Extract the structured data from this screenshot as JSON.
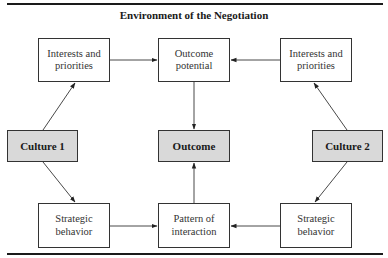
{
  "title": "Environment of the Negotiation",
  "nodes": {
    "interests_left": {
      "label": "Interests and\npriorities"
    },
    "outcome_potential": {
      "label": "Outcome\npotential"
    },
    "interests_right": {
      "label": "Interests and\npriorities"
    },
    "culture_1": {
      "label": "Culture 1"
    },
    "outcome": {
      "label": "Outcome"
    },
    "culture_2": {
      "label": "Culture 2"
    },
    "strategic_left": {
      "label": "Strategic\nbehavior"
    },
    "pattern": {
      "label": "Pattern of\ninteraction"
    },
    "strategic_right": {
      "label": "Strategic\nbehavior"
    }
  },
  "edges": [
    {
      "from": "Culture 1",
      "to": "Interests and priorities (left)"
    },
    {
      "from": "Culture 1",
      "to": "Strategic behavior (left)"
    },
    {
      "from": "Culture 2",
      "to": "Interests and priorities (right)"
    },
    {
      "from": "Culture 2",
      "to": "Strategic behavior (right)"
    },
    {
      "from": "Interests and priorities (left)",
      "to": "Outcome potential"
    },
    {
      "from": "Interests and priorities (right)",
      "to": "Outcome potential"
    },
    {
      "from": "Strategic behavior (left)",
      "to": "Pattern of interaction"
    },
    {
      "from": "Strategic behavior (right)",
      "to": "Pattern of interaction"
    },
    {
      "from": "Outcome potential",
      "to": "Outcome"
    },
    {
      "from": "Pattern of interaction",
      "to": "Outcome"
    }
  ],
  "colors": {
    "shaded_fill": "#d9d9d9",
    "line": "#333333"
  }
}
